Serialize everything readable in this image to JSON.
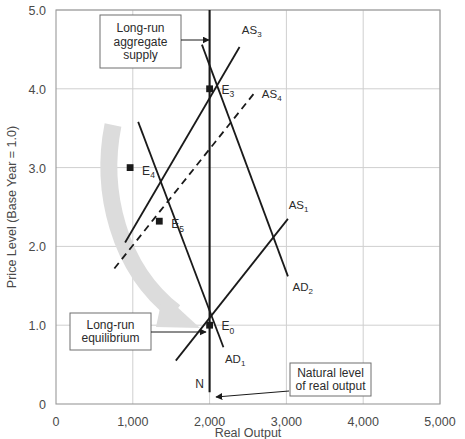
{
  "chart_data": {
    "type": "line",
    "title": "",
    "xlabel": "Real Output",
    "ylabel": "Price Level (Base Year = 1.0)",
    "xlim": [
      0,
      5000
    ],
    "ylim": [
      0,
      5.0
    ],
    "grid": true,
    "legend_position": "inline-labels",
    "x_ticks": [
      "0",
      "1,000",
      "2,000",
      "3,000",
      "4,000",
      "5,000"
    ],
    "x_tick_values": [
      0,
      1000,
      2000,
      3000,
      4000,
      5000
    ],
    "y_ticks": [
      "0",
      "1.0",
      "2.0",
      "3.0",
      "4.0",
      "5.0"
    ],
    "y_tick_values": [
      0,
      1.0,
      2.0,
      3.0,
      4.0,
      5.0
    ],
    "series": [
      {
        "name": "Long-run aggregate supply (LRAS)",
        "label": "",
        "style": "solid-vertical",
        "points": [
          [
            2000,
            0.15
          ],
          [
            2000,
            5.0
          ]
        ]
      },
      {
        "name": "AS1",
        "label": "AS",
        "sub": "1",
        "style": "solid",
        "label_x": 3030,
        "label_y": 2.48,
        "points": [
          [
            1560,
            0.55
          ],
          [
            3020,
            2.35
          ]
        ]
      },
      {
        "name": "AS3",
        "label": "AS",
        "sub": "3",
        "style": "solid",
        "label_x": 2420,
        "label_y": 4.7,
        "points": [
          [
            900,
            2.05
          ],
          [
            2390,
            4.53
          ]
        ]
      },
      {
        "name": "AS4",
        "label": "AS",
        "sub": "4",
        "style": "dashed",
        "label_x": 2680,
        "label_y": 3.88,
        "points": [
          [
            760,
            1.72
          ],
          [
            2610,
            3.98
          ]
        ]
      },
      {
        "name": "AD1",
        "label": "AD",
        "sub": "1",
        "style": "solid",
        "label_x": 2200,
        "label_y": 0.52,
        "points": [
          [
            1070,
            3.58
          ],
          [
            2180,
            0.72
          ]
        ]
      },
      {
        "name": "AD2",
        "label": "AD",
        "sub": "2",
        "style": "solid",
        "label_x": 3080,
        "label_y": 1.44,
        "points": [
          [
            1900,
            4.56
          ],
          [
            3020,
            1.62
          ]
        ]
      }
    ],
    "points": [
      {
        "name": "E0",
        "label": "E",
        "sub": "0",
        "x": 2000,
        "y": 1.0,
        "label_dx": 12,
        "label_dy": 5
      },
      {
        "name": "E3",
        "label": "E",
        "sub": "3",
        "x": 2000,
        "y": 4.0,
        "label_dx": 12,
        "label_dy": 5
      },
      {
        "name": "E4",
        "label": "E",
        "sub": "4",
        "x": 965,
        "y": 3.0,
        "label_dx": 12,
        "label_dy": 7
      },
      {
        "name": "E5",
        "label": "E",
        "sub": "5",
        "x": 1345,
        "y": 2.32,
        "label_dx": 12,
        "label_dy": 7
      }
    ],
    "annotations": [
      {
        "name": "lras-callout",
        "lines": [
          "Long-run",
          "aggregate",
          "supply"
        ],
        "box": {
          "x": 100,
          "y": 15,
          "w": 81,
          "h": 53
        },
        "arrow": {
          "x1": 181,
          "y1": 40,
          "x2": 209,
          "y2": 40
        }
      },
      {
        "name": "equilibrium-callout",
        "lines": [
          "Long-run",
          "equilibrium"
        ],
        "box": {
          "x": 70,
          "y": 313,
          "w": 81,
          "h": 37
        },
        "arrow": {
          "x1": 151,
          "y1": 332,
          "x2": 206,
          "y2": 332
        }
      },
      {
        "name": "natural-output-callout",
        "lines": [
          "Natural level",
          "of real output"
        ],
        "box": {
          "x": 290,
          "y": 363,
          "w": 81,
          "h": 33
        },
        "arrow": {
          "x1": 289,
          "y1": 391,
          "x2": 216,
          "y2": 397
        }
      }
    ],
    "axis_marker": {
      "name": "N",
      "label": "N",
      "x": 1870,
      "y": 0.2
    }
  },
  "icons": {
    "arrow_head": "arrow-head-icon",
    "sweep_arrow": "adjustment-sweep-arrow-icon"
  },
  "colors": {
    "line": "#1a1a1a",
    "grid": "#cfcfcf",
    "axis": "#9a9a9a",
    "text": "#3a3a3a",
    "sweep_arrow": "#dcdcdc",
    "background": "#ffffff"
  }
}
